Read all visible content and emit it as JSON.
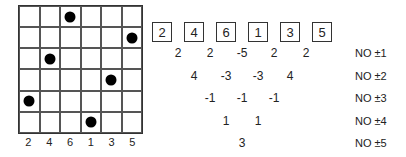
{
  "grid": {
    "size": 6,
    "dot_rows_by_column": [
      4,
      2,
      0,
      5,
      3,
      1
    ],
    "column_labels": [
      "2",
      "4",
      "6",
      "1",
      "3",
      "5"
    ]
  },
  "sequence": [
    "2",
    "4",
    "6",
    "1",
    "3",
    "5"
  ],
  "difference_rows": [
    {
      "values": [
        "2",
        "2",
        "-5",
        "2",
        "2"
      ],
      "label": "NO ±1"
    },
    {
      "values": [
        "4",
        "-3",
        "-3",
        "4"
      ],
      "label": "NO ±2"
    },
    {
      "values": [
        "-1",
        "-1",
        "-1"
      ],
      "label": "NO ±3"
    },
    {
      "values": [
        "1",
        "1"
      ],
      "label": "NO ±4"
    },
    {
      "values": [
        "3"
      ],
      "label": "NO ±5"
    }
  ]
}
